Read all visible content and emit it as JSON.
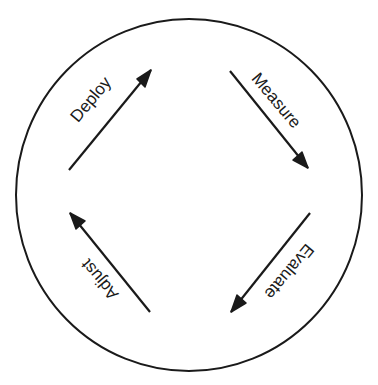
{
  "diagram": {
    "type": "cycle",
    "stroke_color": "#1a1a1a",
    "background": "#ffffff",
    "circle": {
      "cx": 189,
      "cy": 195,
      "rx": 173,
      "ry": 176
    },
    "steps": [
      {
        "label": "Deploy",
        "direction": "up-right",
        "from": [
          69,
          170
        ],
        "to": [
          151,
          70
        ],
        "label_pos": [
          95,
          103
        ],
        "label_angle": -50
      },
      {
        "label": "Measure",
        "direction": "down-right",
        "from": [
          230,
          71
        ],
        "to": [
          308,
          168
        ],
        "label_pos": [
          272,
          104
        ],
        "label_angle": 50
      },
      {
        "label": "Evaluate",
        "direction": "down-left",
        "from": [
          310,
          213
        ],
        "to": [
          231,
          312
        ],
        "label_pos": [
          285,
          268
        ],
        "label_angle": 130
      },
      {
        "label": "Adjust",
        "direction": "up-left",
        "from": [
          150,
          312
        ],
        "to": [
          70,
          213
        ],
        "label_pos": [
          104,
          276
        ],
        "label_angle": 230
      }
    ]
  }
}
